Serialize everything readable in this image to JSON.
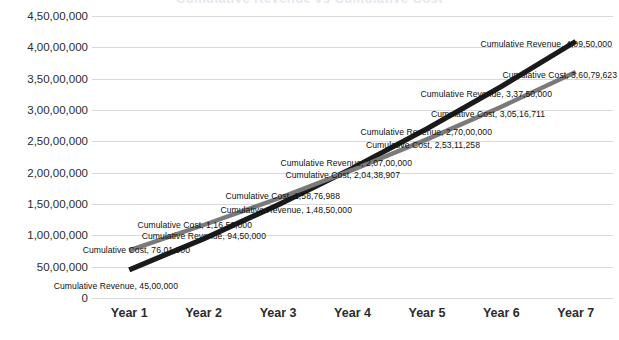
{
  "chart_title": "Cumulative Revenue vs Cumulative Cost",
  "chart_data": {
    "type": "line",
    "title": "Cumulative Revenue vs Cumulative Cost",
    "xlabel": "",
    "ylabel": "",
    "grid": true,
    "legend": "none",
    "ylim": [
      0,
      45000000
    ],
    "ytick_step": 5000000,
    "categories": [
      "Year 1",
      "Year 2",
      "Year 3",
      "Year 4",
      "Year 5",
      "Year 6",
      "Year 7"
    ],
    "ytick_labels": [
      "4,50,00,000",
      "4,00,00,000",
      "3,50,00,000",
      "3,00,00,000",
      "2,50,00,000",
      "2,00,00,000",
      "1,50,00,000",
      "1,00,00,000",
      "50,00,000",
      "0"
    ],
    "ytick_values": [
      45000000,
      40000000,
      35000000,
      30000000,
      25000000,
      20000000,
      15000000,
      10000000,
      5000000,
      0
    ],
    "series": [
      {
        "name": "Cumulative Revenue",
        "color": "#1a1a1a",
        "values": [
          4500000,
          9450000,
          14850000,
          20700000,
          27000000,
          33750000,
          40950000
        ],
        "value_labels": [
          "45,00,000",
          "94,50,000",
          "1,48,50,000",
          "2,07,00,000",
          "2,70,00,000",
          "3,37,50,000",
          "4,09,50,000"
        ]
      },
      {
        "name": "Cumulative Cost",
        "color": "#7a7a7a",
        "values": [
          7601000,
          11650000,
          15876988,
          20438907,
          25311258,
          30516711,
          36079623
        ],
        "value_labels": [
          "76,01,000",
          "1,16,50,000",
          "1,58,76,988",
          "2,04,38,907",
          "2,53,11,258",
          "3,05,16,711",
          "3,60,79,623"
        ]
      }
    ],
    "data_labels": [
      {
        "text": "Cumulative Revenue, 45,00,000",
        "x": 178,
        "y": 286,
        "align": "end"
      },
      {
        "text": "Cumulative Cost, 76,01,000",
        "x": 190,
        "y": 250,
        "align": "end"
      },
      {
        "text": "Cumulative Revenue, 94,50,000",
        "x": 266,
        "y": 236,
        "align": "end"
      },
      {
        "text": "Cumulative Cost, 1,16,50,000",
        "x": 252,
        "y": 225,
        "align": "end"
      },
      {
        "text": "Cumulative Revenue, 1,48,50,000",
        "x": 352,
        "y": 210,
        "align": "end"
      },
      {
        "text": "Cumulative Cost, 1,58,76,988",
        "x": 340,
        "y": 196,
        "align": "end"
      },
      {
        "text": "Cumulative Revenue, 2,07,00,000",
        "x": 412,
        "y": 163,
        "align": "end"
      },
      {
        "text": "Cumulative Cost, 2,04,38,907",
        "x": 400,
        "y": 175,
        "align": "end"
      },
      {
        "text": "Cumulative Revenue, 2,70,00,000",
        "x": 492,
        "y": 132,
        "align": "end"
      },
      {
        "text": "Cumulative Cost, 2,53,11,258",
        "x": 480,
        "y": 145,
        "align": "end"
      },
      {
        "text": "Cumulative Cost, 3,05,16,711",
        "x": 545,
        "y": 114,
        "align": "end"
      },
      {
        "text": "Cumulative Revenue, 3,37,50,000",
        "x": 552,
        "y": 94,
        "align": "end"
      },
      {
        "text": "Cumulative Cost, 3,60,79,623",
        "x": 617,
        "y": 75,
        "align": "end"
      },
      {
        "text": "Cumulative Revenue, 4,09,50,000",
        "x": 612,
        "y": 44,
        "align": "end"
      }
    ]
  }
}
